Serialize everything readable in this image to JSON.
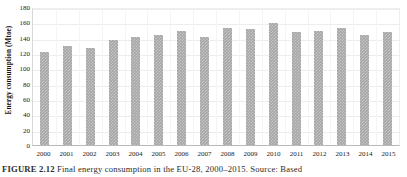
{
  "chart_data": {
    "type": "bar",
    "title": "",
    "subtitle": "",
    "xlabel": "",
    "ylabel": "Energy consumption (Mtoe)",
    "categories": [
      "2000",
      "2001",
      "2002",
      "2003",
      "2004",
      "2005",
      "2006",
      "2007",
      "2008",
      "2009",
      "2010",
      "2011",
      "2012",
      "2013",
      "2014",
      "2015"
    ],
    "values": [
      121,
      129,
      126,
      137,
      141,
      144,
      149,
      141,
      152,
      151,
      159,
      148,
      149,
      152,
      143,
      148
    ],
    "series": [
      {
        "name": "Energy consumption",
        "values": [
          121,
          129,
          126,
          137,
          141,
          144,
          149,
          141,
          152,
          151,
          159,
          148,
          149,
          152,
          143,
          148
        ]
      }
    ],
    "ylim": [
      0,
      180
    ],
    "yticks": [
      0,
      20,
      40,
      60,
      80,
      100,
      120,
      140,
      160,
      180
    ],
    "ytick_labels": [
      "0",
      "20",
      "40",
      "60",
      "80",
      "100",
      "120",
      "140",
      "160",
      "180"
    ],
    "grid": true,
    "grid_axis": "both",
    "legend": false,
    "legend_position": "none",
    "bar_color": "#a6a6a6",
    "bar_pattern": "checkered",
    "gridline_color": "#ededed",
    "axis_color": "#b9b9b9",
    "text_color": "#1a1a1a"
  },
  "caption": {
    "label": "FIGURE 2.12",
    "text": "Final energy consumption in the EU-28, 2000–2015. Source: Based"
  }
}
